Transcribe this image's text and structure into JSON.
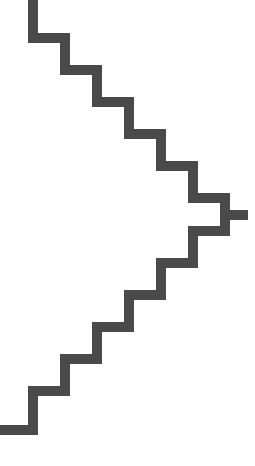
{
  "canvas": {
    "width": 255,
    "height": 466,
    "background_color": "#ffffff",
    "title": "Staircase zigzag polyline"
  },
  "figure": {
    "name": "staircase-polyline",
    "stroke_color": "#4a4a4a",
    "stroke_width": 10,
    "fill": "none",
    "line_join": "miter",
    "line_cap": "butt",
    "step_pitch_x": 32,
    "step_pitch_y": 32,
    "upper_step_count": 6,
    "lower_step_count": 6,
    "points": "33,0 33,38 65,38 65,70 97,70 97,102 129,102 129,134 161,134 161,166 193,166 193,198 225,198 225,215 248,215 225,215 225,231 193,231 193,263 161,263 161,295 129,295 129,327 97,327 97,359 65,359 65,391 33,391 33,430 0,430",
    "upper_path": "M 33 0 L 33 38 L 65 38 L 65 70 L 97 70 L 97 102 L 129 102 L 129 134 L 161 134 L 161 166 L 193 166 L 193 198 L 225 198 L 225 215",
    "tail_path": "M 225 215 L 248 215",
    "lower_path": "M 225 215 L 225 231 L 193 231 L 193 263 L 161 263 L 161 295 L 129 295 L 129 327 L 97 327 L 97 359 L 65 359 L 65 391 L 33 391 L 33 430 L 0 430",
    "start_point_label": "top edge at x=33",
    "end_point_label": "left edge at y=430",
    "rightmost_point_label": "x=248, y=215"
  },
  "chart_data": {
    "type": "line",
    "xlabel": "",
    "ylabel": "",
    "xlim": [
      0,
      255
    ],
    "ylim": [
      0,
      466
    ],
    "grid": false,
    "legend": "none",
    "series": [
      {
        "name": "staircase",
        "color": "#4a4a4a",
        "x": [
          33,
          33,
          65,
          65,
          97,
          97,
          129,
          129,
          161,
          161,
          193,
          193,
          225,
          225,
          248,
          225,
          225,
          193,
          193,
          161,
          161,
          129,
          129,
          97,
          97,
          65,
          65,
          33,
          33,
          0
        ],
        "y": [
          0,
          38,
          38,
          70,
          70,
          102,
          102,
          134,
          134,
          166,
          166,
          198,
          198,
          215,
          215,
          215,
          231,
          231,
          263,
          263,
          295,
          295,
          327,
          327,
          359,
          359,
          391,
          391,
          430,
          430
        ]
      }
    ]
  }
}
